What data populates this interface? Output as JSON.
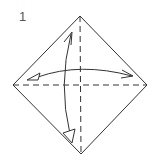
{
  "diagram": {
    "step_number": "1",
    "type": "origami-fold-step",
    "paper": {
      "shape": "square-diamond",
      "stroke": "#333333"
    },
    "crease_lines": [
      "horizontal-diagonal-valley",
      "vertical-diagonal-valley"
    ],
    "arrows": [
      {
        "name": "horizontal-fold-unfold-arrow",
        "direction": "left-right"
      },
      {
        "name": "vertical-fold-unfold-arrow",
        "direction": "up-down"
      }
    ]
  }
}
